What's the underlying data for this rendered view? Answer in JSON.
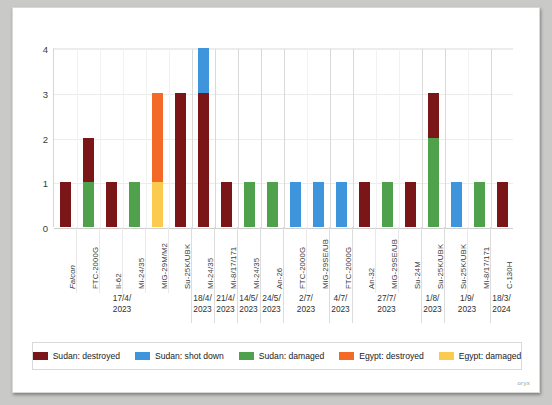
{
  "chart_data": {
    "type": "bar",
    "stacked": true,
    "title": "",
    "subtitle": "",
    "xlabel": "",
    "ylabel": "",
    "ylim": [
      0,
      4
    ],
    "yticks": [
      "0",
      "1",
      "2",
      "3",
      "4"
    ],
    "grid": true,
    "legend_position": "bottom",
    "series": [
      {
        "name": "Sudan: destroyed",
        "color": "#7B1618",
        "key": "sudan_destroyed"
      },
      {
        "name": "Sudan: shot down",
        "color": "#3E95DB",
        "key": "sudan_shotdown"
      },
      {
        "name": "Sudan: damaged",
        "color": "#4FA14B",
        "key": "sudan_damaged"
      },
      {
        "name": "Egypt: destroyed",
        "color": "#F26A25",
        "key": "egypt_destroyed"
      },
      {
        "name": "Egypt: damaged",
        "color": "#FBCB50",
        "key": "egypt_damaged"
      }
    ],
    "categories": [
      "Falcon",
      "FTC-2000G",
      "Il-62",
      "Mi-24/35",
      "MiG-29M/M2",
      "Su-25K/UBK",
      "Mi-24/35",
      "Mi-8/17/171",
      "Mi-24/35",
      "An-26",
      "FTC-2000G",
      "MiG-29SE/UB",
      "FTC-2000G",
      "An-32",
      "MiG-29SE/UB",
      "Su-24M",
      "Su-25K/UBK",
      "Su-25K/UBK",
      "Mi-8/17/171",
      "C-130H"
    ],
    "bars": [
      {
        "label": "Falcon",
        "group": 0,
        "italic": true,
        "total": 1,
        "segments": [
          {
            "key": "sudan_destroyed",
            "value": 1
          }
        ]
      },
      {
        "label": "FTC-2000G",
        "group": 0,
        "italic": false,
        "total": 2,
        "segments": [
          {
            "key": "sudan_damaged",
            "value": 1
          },
          {
            "key": "sudan_destroyed",
            "value": 1
          }
        ]
      },
      {
        "label": "Il-62",
        "group": 0,
        "italic": false,
        "total": 1,
        "segments": [
          {
            "key": "sudan_destroyed",
            "value": 1
          }
        ]
      },
      {
        "label": "Mi-24/35",
        "group": 0,
        "italic": false,
        "total": 1,
        "segments": [
          {
            "key": "sudan_damaged",
            "value": 1
          }
        ]
      },
      {
        "label": "MiG-29M/M2",
        "group": 0,
        "italic": false,
        "total": 3,
        "segments": [
          {
            "key": "egypt_damaged",
            "value": 1
          },
          {
            "key": "egypt_destroyed",
            "value": 2
          }
        ]
      },
      {
        "label": "Su-25K/UBK",
        "group": 0,
        "italic": false,
        "total": 3,
        "segments": [
          {
            "key": "sudan_destroyed",
            "value": 3
          }
        ]
      },
      {
        "label": "Mi-24/35",
        "group": 1,
        "italic": false,
        "total": 4,
        "segments": [
          {
            "key": "sudan_destroyed",
            "value": 3
          },
          {
            "key": "sudan_shotdown",
            "value": 1
          }
        ]
      },
      {
        "label": "Mi-8/17/171",
        "group": 2,
        "italic": false,
        "total": 1,
        "segments": [
          {
            "key": "sudan_destroyed",
            "value": 1
          }
        ]
      },
      {
        "label": "Mi-24/35",
        "group": 3,
        "italic": false,
        "total": 1,
        "segments": [
          {
            "key": "sudan_damaged",
            "value": 1
          }
        ]
      },
      {
        "label": "An-26",
        "group": 4,
        "italic": false,
        "total": 1,
        "segments": [
          {
            "key": "sudan_damaged",
            "value": 1
          }
        ]
      },
      {
        "label": "FTC-2000G",
        "group": 5,
        "italic": false,
        "total": 1,
        "segments": [
          {
            "key": "sudan_shotdown",
            "value": 1
          }
        ]
      },
      {
        "label": "MiG-29SE/UB",
        "group": 5,
        "italic": false,
        "total": 1,
        "segments": [
          {
            "key": "sudan_shotdown",
            "value": 1
          }
        ]
      },
      {
        "label": "FTC-2000G",
        "group": 6,
        "italic": false,
        "total": 1,
        "segments": [
          {
            "key": "sudan_shotdown",
            "value": 1
          }
        ]
      },
      {
        "label": "An-32",
        "group": 7,
        "italic": false,
        "total": 1,
        "segments": [
          {
            "key": "sudan_destroyed",
            "value": 1
          }
        ]
      },
      {
        "label": "MiG-29SE/UB",
        "group": 7,
        "italic": false,
        "total": 1,
        "segments": [
          {
            "key": "sudan_damaged",
            "value": 1
          }
        ]
      },
      {
        "label": "Su-24M",
        "group": 7,
        "italic": false,
        "total": 1,
        "segments": [
          {
            "key": "sudan_destroyed",
            "value": 1
          }
        ]
      },
      {
        "label": "Su-25K/UBK",
        "group": 8,
        "italic": false,
        "total": 3,
        "segments": [
          {
            "key": "sudan_damaged",
            "value": 2
          },
          {
            "key": "sudan_destroyed",
            "value": 1
          }
        ]
      },
      {
        "label": "Su-25K/UBK",
        "group": 9,
        "italic": false,
        "total": 1,
        "segments": [
          {
            "key": "sudan_shotdown",
            "value": 1
          }
        ]
      },
      {
        "label": "Mi-8/17/171",
        "group": 9,
        "italic": false,
        "total": 1,
        "segments": [
          {
            "key": "sudan_damaged",
            "value": 1
          }
        ]
      },
      {
        "label": "C-130H",
        "group": 10,
        "italic": false,
        "total": 1,
        "segments": [
          {
            "key": "sudan_destroyed",
            "value": 1
          }
        ]
      }
    ],
    "groups": [
      {
        "day": "17/4/",
        "year": "2023",
        "count": 6
      },
      {
        "day": "18/4/",
        "year": "2023",
        "count": 1
      },
      {
        "day": "21/4/",
        "year": "2023",
        "count": 1
      },
      {
        "day": "14/5/",
        "year": "2023",
        "count": 1
      },
      {
        "day": "24/5/",
        "year": "2023",
        "count": 1
      },
      {
        "day": "2/7/",
        "year": "2023",
        "count": 2
      },
      {
        "day": "4/7/",
        "year": "2023",
        "count": 1
      },
      {
        "day": "27/7/",
        "year": "2023",
        "count": 3
      },
      {
        "day": "1/8/",
        "year": "2023",
        "count": 1
      },
      {
        "day": "1/9/",
        "year": "2023",
        "count": 2
      },
      {
        "day": "18/3/",
        "year": "2024",
        "count": 1
      }
    ]
  },
  "legend": {
    "items": [
      {
        "label": "Sudan: destroyed",
        "color": "#7B1618"
      },
      {
        "label": "Sudan: shot down",
        "color": "#3E95DB"
      },
      {
        "label": "Sudan: damaged",
        "color": "#4FA14B"
      },
      {
        "label": "Egypt: destroyed",
        "color": "#F26A25"
      },
      {
        "label": "Egypt: damaged",
        "color": "#FBCB50"
      }
    ]
  },
  "watermark": "oryx"
}
